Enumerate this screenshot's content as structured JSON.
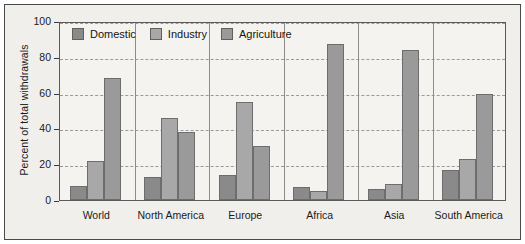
{
  "chart_data": {
    "type": "bar",
    "title": "",
    "subtitle": "",
    "xlabel": "",
    "ylabel": "Percent of total withdrawals",
    "ylim": [
      0,
      100
    ],
    "yticks": [
      0,
      20,
      40,
      60,
      80,
      100
    ],
    "grid": true,
    "legend_position": "top-left inside plot",
    "categories": [
      "World",
      "North America",
      "Europe",
      "Africa",
      "Asia",
      "South America"
    ],
    "series": [
      {
        "name": "Domestic",
        "color": "#8a8a8a",
        "values": [
          8,
          13,
          14,
          7,
          6,
          17
        ]
      },
      {
        "name": "Industry",
        "color": "#a8a8a8",
        "values": [
          22,
          46,
          55,
          5,
          9,
          23
        ]
      },
      {
        "name": "Agriculture",
        "color": "#9a9a9a",
        "values": [
          68,
          38,
          30,
          87,
          84,
          59
        ]
      }
    ]
  },
  "axis": {
    "y_title": "Percent of total withdrawals",
    "y_tick_labels": [
      "0",
      "20",
      "40",
      "60",
      "80",
      "100"
    ],
    "x_tick_labels": [
      "World",
      "North America",
      "Europe",
      "Africa",
      "Asia",
      "South America"
    ]
  },
  "legend": {
    "items": [
      {
        "label": "Domestic",
        "swatch": "domestic-swatch-icon"
      },
      {
        "label": "Industry",
        "swatch": "industry-swatch-icon"
      },
      {
        "label": "Agriculture",
        "swatch": "agriculture-swatch-icon"
      }
    ]
  },
  "colors": {
    "domestic": "#8a8a8a",
    "industry": "#a8a8a8",
    "agriculture": "#9a9a9a",
    "plot_background": "#f4f3f0",
    "figure_background": "#f0efeb",
    "gridline": "#9a9a9a",
    "axis": "#5a5a5a",
    "text": "#1b1b1b"
  }
}
